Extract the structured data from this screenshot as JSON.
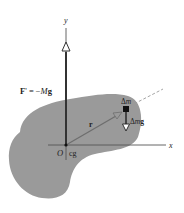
{
  "diagram": {
    "axes": {
      "x_label": "x",
      "y_label": "y",
      "origin_label": "O",
      "cg_label": "cg"
    },
    "force": {
      "label_F": "F",
      "label_prime": "'",
      "label_eq": " = −",
      "label_M": "M",
      "label_g": "g"
    },
    "position_vector": {
      "label": "r"
    },
    "mass_element": {
      "label_delta": "Δ",
      "label_m": "m"
    },
    "weight_element": {
      "label_delta": "Δ",
      "label_m": "m",
      "label_g": "g"
    },
    "colors": {
      "body_fill": "#9a9a9a",
      "axis": "#555555",
      "vector": "#333333",
      "vector_r": "#6e6e6e",
      "mass": "#111111",
      "dashed": "#9a9a9a"
    }
  }
}
